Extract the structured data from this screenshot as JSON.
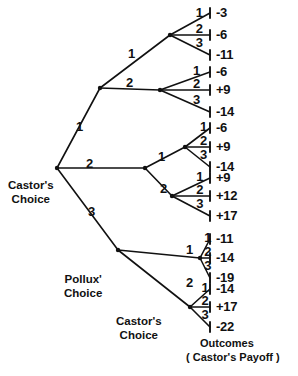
{
  "diagram": {
    "node_labels": [
      {
        "id": "root",
        "text": "Castor's\nChoice",
        "x": 8,
        "y": 178
      },
      {
        "id": "level2",
        "text": "Pollux'\nChoice",
        "x": 66,
        "y": 274
      },
      {
        "id": "level3",
        "text": "Castor's\nChoice",
        "x": 118,
        "y": 316
      }
    ],
    "caption": {
      "line1": "Outcomes",
      "line2": "( Castor's Payoff )",
      "x": 190,
      "y": 338
    },
    "root_branches": [
      {
        "label": "1",
        "x": 76,
        "y": 120
      },
      {
        "label": "2",
        "x": 86,
        "y": 157
      },
      {
        "label": "3",
        "x": 88,
        "y": 205
      }
    ],
    "mid_branches": [
      {
        "label": "1",
        "x": 128,
        "y": 47
      },
      {
        "label": "2",
        "x": 126,
        "y": 76
      },
      {
        "label": "1",
        "x": 158,
        "y": 150
      },
      {
        "label": "2",
        "x": 160,
        "y": 182
      },
      {
        "label": "1",
        "x": 186,
        "y": 243
      },
      {
        "label": "2",
        "x": 186,
        "y": 276
      }
    ],
    "leaf_branch_labels": [
      "1",
      "2",
      "3"
    ],
    "groups": [
      {
        "node_x": 170,
        "node_y": 35,
        "outcomes": [
          {
            "branch": "1",
            "payoff": "-3",
            "y": 13
          },
          {
            "branch": "2",
            "payoff": "-6",
            "y": 35
          },
          {
            "branch": "3",
            "payoff": "-11",
            "y": 55
          }
        ]
      },
      {
        "node_x": 160,
        "node_y": 90,
        "outcomes": [
          {
            "branch": "1",
            "payoff": "-6",
            "y": 72
          },
          {
            "branch": "2",
            "payoff": "+9",
            "y": 90
          },
          {
            "branch": "3",
            "payoff": "-14",
            "y": 112
          }
        ]
      },
      {
        "node_x": 185,
        "node_y": 147,
        "outcomes": [
          {
            "branch": "1",
            "payoff": "-6",
            "y": 128
          },
          {
            "branch": "2",
            "payoff": "+9",
            "y": 147
          },
          {
            "branch": "3",
            "payoff": "-14",
            "y": 167
          }
        ]
      },
      {
        "node_x": 172,
        "node_y": 196,
        "outcomes": [
          {
            "branch": "1",
            "payoff": "+9",
            "y": 178
          },
          {
            "branch": "2",
            "payoff": "+12",
            "y": 196
          },
          {
            "branch": "3",
            "payoff": "+17",
            "y": 216
          }
        ]
      },
      {
        "node_x": 200,
        "node_y": 258,
        "outcomes": [
          {
            "branch": "1",
            "payoff": "-11",
            "y": 239
          },
          {
            "branch": "2",
            "payoff": "-14",
            "y": 258
          },
          {
            "branch": "3",
            "payoff": "-19",
            "y": 278
          }
        ]
      },
      {
        "node_x": 190,
        "node_y": 307,
        "outcomes": [
          {
            "branch": "1",
            "payoff": "-14",
            "y": 289
          },
          {
            "branch": "2",
            "payoff": "+17",
            "y": 307
          },
          {
            "branch": "3",
            "payoff": "-22",
            "y": 327
          }
        ]
      }
    ],
    "geometry": {
      "root": {
        "x": 57,
        "y": 168
      },
      "mid_nodes": [
        {
          "x": 100,
          "y": 88
        },
        {
          "x": 145,
          "y": 168
        },
        {
          "x": 118,
          "y": 250
        }
      ],
      "terminal_x": 210,
      "payoff_text_x": 216,
      "tick_half_height": 5
    },
    "colors": {
      "ink": "#111111",
      "background": "#ffffff"
    }
  }
}
